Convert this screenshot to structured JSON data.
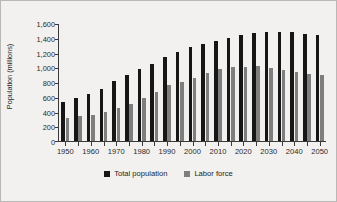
{
  "chart_data": {
    "type": "bar",
    "title": "",
    "xlabel": "",
    "ylabel": "Population (millions)",
    "ylim": [
      0,
      1600
    ],
    "yticks": [
      0,
      200,
      400,
      600,
      800,
      1000,
      1200,
      1400,
      1600
    ],
    "ytick_labels": [
      "0",
      "200",
      "400",
      "600",
      "800",
      "1,000",
      "1,200",
      "1,400",
      "1,600"
    ],
    "grid": false,
    "legend_position": "bottom-center",
    "categories": [
      "1950",
      "1955",
      "1960",
      "1965",
      "1970",
      "1975",
      "1980",
      "1985",
      "1990",
      "1995",
      "2000",
      "2005",
      "2010",
      "2015",
      "2020",
      "2025",
      "2030",
      "2035",
      "2040",
      "2045",
      "2050"
    ],
    "xtick_labels_shown": [
      "1950",
      "1960",
      "1970",
      "1980",
      "1990",
      "2000",
      "2010",
      "2020",
      "2030",
      "2040",
      "2050"
    ],
    "series": [
      {
        "name": "Total population",
        "color": "#161616",
        "values": [
          530,
          590,
          645,
          715,
          815,
          905,
          980,
          1055,
          1150,
          1215,
          1280,
          1325,
          1370,
          1415,
          1450,
          1480,
          1485,
          1485,
          1485,
          1465,
          1450
        ]
      },
      {
        "name": "Labor force",
        "color": "#7e7e7e",
        "values": [
          320,
          340,
          360,
          400,
          450,
          510,
          585,
          670,
          760,
          805,
          865,
          930,
          985,
          1015,
          1015,
          1020,
          1000,
          970,
          940,
          920,
          900
        ]
      }
    ]
  },
  "legend": {
    "items": [
      {
        "label": "Total population",
        "key": "total"
      },
      {
        "label": "Labor force",
        "key": "labor"
      }
    ]
  }
}
